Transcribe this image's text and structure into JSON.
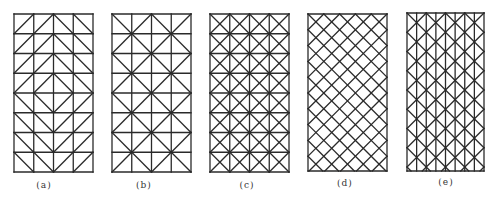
{
  "figure": {
    "stroke_color": "#2a2a2a",
    "stroke_width": 1.3,
    "panels": [
      {
        "id": "a",
        "label": "(a)",
        "pattern": "diamond",
        "x": 14,
        "y": 14,
        "w": 79,
        "h": 158,
        "cols": 4,
        "rows": 8,
        "label_x": 44,
        "label_y": 186
      },
      {
        "id": "b",
        "label": "(b)",
        "pattern": "unionjack",
        "x": 112,
        "y": 14,
        "w": 79,
        "h": 158,
        "cols": 4,
        "rows": 8,
        "label_x": 144,
        "label_y": 186
      },
      {
        "id": "c",
        "label": "(c)",
        "pattern": "xcell",
        "x": 210,
        "y": 14,
        "w": 79,
        "h": 158,
        "cols": 4,
        "rows": 8,
        "label_x": 247,
        "label_y": 186
      },
      {
        "id": "d",
        "label": "(d)",
        "pattern": "diagonal",
        "x": 308,
        "y": 14,
        "w": 79,
        "h": 157,
        "cols": 5,
        "rows": 10,
        "label_x": 345,
        "label_y": 184
      },
      {
        "id": "e",
        "label": "(e)",
        "pattern": "strips",
        "x": 407,
        "y": 13,
        "w": 77,
        "h": 158,
        "cols": 8,
        "rows": 8,
        "label_x": 446,
        "label_y": 183
      }
    ]
  }
}
